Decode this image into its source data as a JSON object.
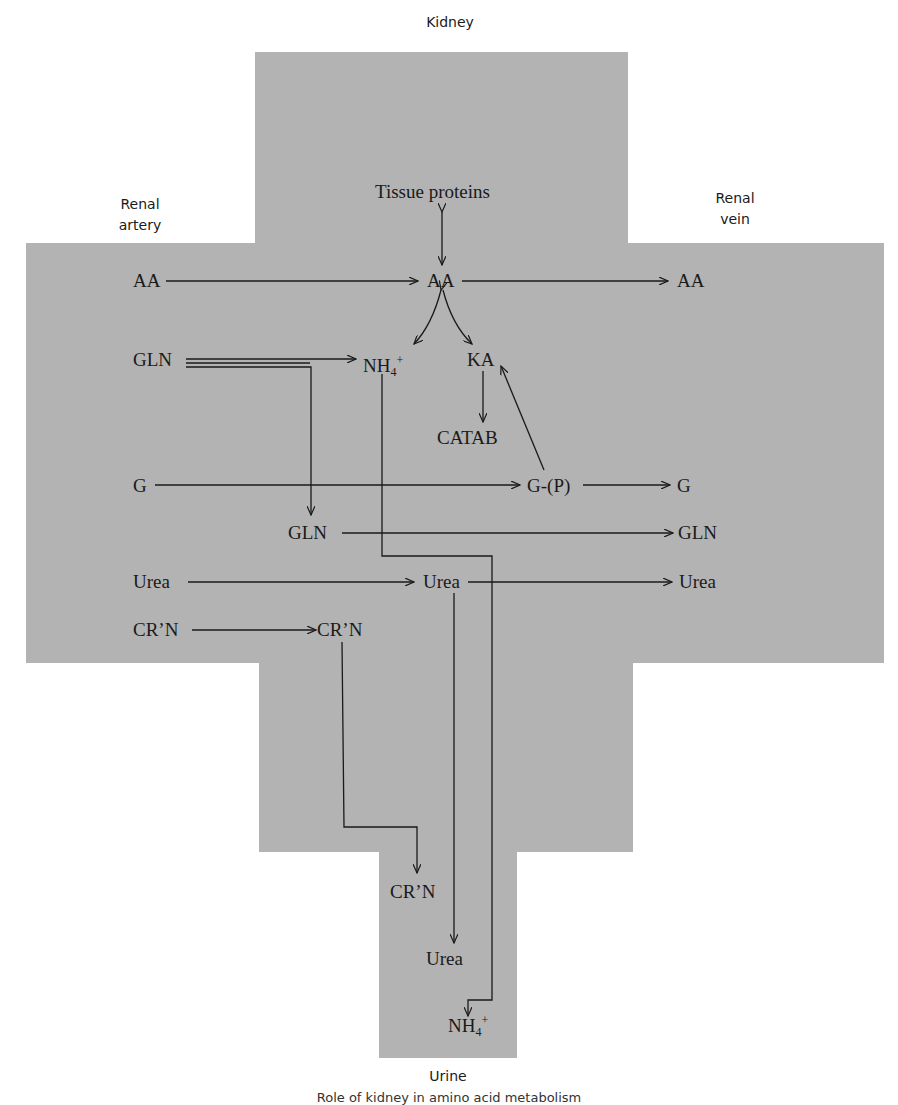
{
  "title": "Kidney",
  "compartments": {
    "kidney": "Kidney",
    "renal_artery": "Renal\nartery",
    "renal_vein": "Renal\nvein",
    "urine": "Urine"
  },
  "labels": {
    "renal_artery_line1": "Renal",
    "renal_artery_line2": "artery",
    "renal_vein_line1": "Renal",
    "renal_vein_line2": "vein"
  },
  "nodes": {
    "tissue_proteins": "Tissue proteins",
    "artery_aa": "AA",
    "kidney_aa": "AA",
    "vein_aa": "AA",
    "artery_gln": "GLN",
    "nh4": "NH",
    "nh4_sub": "4",
    "nh4_sup": "+",
    "ka": "KA",
    "catab": "CATAB",
    "artery_g": "G",
    "gp": "G-(P)",
    "vein_g": "G",
    "kidney_gln": "GLN",
    "vein_gln": "GLN",
    "artery_urea": "Urea",
    "kidney_urea": "Urea",
    "vein_urea": "Urea",
    "artery_crn": "CR’N",
    "kidney_crn": "CR’N",
    "urine_crn": "CR’N",
    "urine_urea": "Urea",
    "urine_nh4": "NH",
    "urine_nh4_sub": "4",
    "urine_nh4_sup": "+"
  },
  "edges": [
    {
      "from": "Tissue proteins",
      "to": "AA (kidney)",
      "type": "bidirectional"
    },
    {
      "from": "AA (artery)",
      "to": "AA (kidney)"
    },
    {
      "from": "AA (kidney)",
      "to": "AA (vein)"
    },
    {
      "from": "AA (kidney)",
      "to": "NH4+",
      "type": "bidirectional-curve"
    },
    {
      "from": "AA (kidney)",
      "to": "KA",
      "type": "bidirectional-curve"
    },
    {
      "from": "GLN (artery)",
      "to": "NH4+"
    },
    {
      "from": "GLN (artery)",
      "to": "GLN (kidney)"
    },
    {
      "from": "KA",
      "to": "CATAB"
    },
    {
      "from": "G-(P)",
      "to": "KA"
    },
    {
      "from": "G (artery)",
      "to": "G-(P)"
    },
    {
      "from": "G-(P)",
      "to": "G (vein)"
    },
    {
      "from": "GLN (kidney)",
      "to": "GLN (vein)"
    },
    {
      "from": "Urea (artery)",
      "to": "Urea (kidney)"
    },
    {
      "from": "Urea (kidney)",
      "to": "Urea (vein)"
    },
    {
      "from": "Urea (kidney)",
      "to": "Urea (urine)"
    },
    {
      "from": "NH4+ (kidney)",
      "to": "NH4+ (urine)"
    },
    {
      "from": "CR'N (artery)",
      "to": "CR'N (kidney)"
    },
    {
      "from": "CR'N (kidney)",
      "to": "CR'N (urine)"
    }
  ],
  "caption": "Role of kidney in amino acid metabolism",
  "colors": {
    "region_fill": "#b3b3b3",
    "line": "#1a1a1a",
    "background": "#ffffff"
  }
}
